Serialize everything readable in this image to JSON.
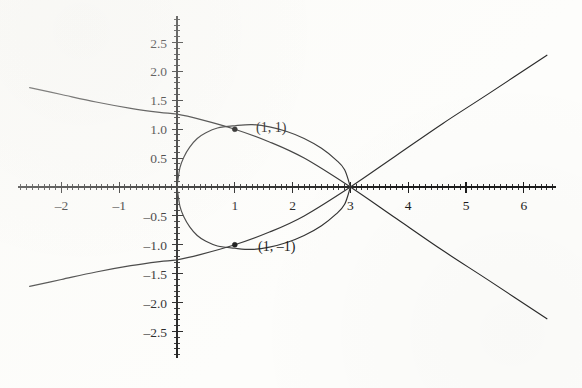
{
  "figure": {
    "title": "",
    "background_color": "#fdfdfb",
    "ink_color": "#2a2a2a",
    "point_labels": [
      {
        "name": "label-point-1-1",
        "text": "(1, 1)",
        "x": 1,
        "y": 1,
        "px": 256,
        "py": 132
      },
      {
        "name": "label-point-1-neg1",
        "text": "(1, –1)",
        "x": 1,
        "y": -1,
        "px": 258,
        "py": 251
      }
    ]
  },
  "axes": {
    "origin_px": {
      "x": 177,
      "y": 187
    },
    "scale_px_per_unit": {
      "x": 57.8,
      "y": 57.8
    },
    "x_axis": {
      "name": "x-axis",
      "range": [
        -2.75,
        6.55
      ],
      "tick_interval_major": 1,
      "tick_interval_minor": 0.1,
      "tick_labels": [
        "–2",
        "–1",
        "1",
        "2",
        "3",
        "4",
        "5",
        "6"
      ],
      "tick_values": [
        -2,
        -1,
        1,
        2,
        3,
        4,
        5,
        6
      ],
      "label_offset_px": 17
    },
    "y_axis": {
      "name": "y-axis",
      "range": [
        -2.95,
        2.95
      ],
      "tick_interval_major": 0.5,
      "tick_interval_minor": 0.1,
      "tick_labels": [
        "2.5",
        "2.0",
        "1.5",
        "1.0",
        "0.5",
        "–0.5",
        "–1.0",
        "–1.5",
        "–2.0",
        "–2.5"
      ],
      "tick_values": [
        2.5,
        2.0,
        1.5,
        1.0,
        0.5,
        -0.5,
        -1.0,
        -1.5,
        -2.0,
        -2.5
      ],
      "label_offset_px": 10
    }
  },
  "chart_data": {
    "type": "line",
    "title": "",
    "xlabel": "",
    "ylabel": "",
    "xlim": [
      -2.75,
      6.55
    ],
    "ylim": [
      -2.95,
      2.95
    ],
    "grid": false,
    "legend": null,
    "annotations": [
      {
        "text": "(1, 1)",
        "x": 1,
        "y": 1
      },
      {
        "text": "(1, –1)",
        "x": 1,
        "y": -1
      }
    ],
    "markers": [
      {
        "x": 1,
        "y": 1,
        "style": "filled-circle",
        "size_px": 5
      },
      {
        "x": 1,
        "y": -1,
        "style": "filled-circle",
        "size_px": 5
      }
    ],
    "series": [
      {
        "name": "loop-curve-upper",
        "description": "Upper half of closed loop from origin through (1,1) to (3,0)",
        "x": [
          0.0,
          0.05,
          0.12,
          0.22,
          0.35,
          0.5,
          0.7,
          1.0,
          1.3,
          1.6,
          1.9,
          2.2,
          2.5,
          2.75,
          2.9,
          3.0
        ],
        "y": [
          0.0,
          0.33,
          0.52,
          0.69,
          0.84,
          0.94,
          1.02,
          1.06,
          1.08,
          1.04,
          0.96,
          0.84,
          0.67,
          0.47,
          0.3,
          0.0
        ]
      },
      {
        "name": "loop-curve-lower",
        "description": "Lower half of closed loop from origin through (1,-1) to (3,0)",
        "x": [
          0.0,
          0.05,
          0.12,
          0.22,
          0.35,
          0.5,
          0.7,
          1.0,
          1.3,
          1.6,
          1.9,
          2.2,
          2.5,
          2.75,
          2.9,
          3.0
        ],
        "y": [
          0.0,
          -0.33,
          -0.52,
          -0.69,
          -0.84,
          -0.94,
          -1.02,
          -1.06,
          -1.08,
          -1.04,
          -0.96,
          -0.84,
          -0.67,
          -0.47,
          -0.3,
          0.0
        ]
      },
      {
        "name": "rising-branch",
        "description": "Increasing curve from (1,-1) region up through (1,1) to upper right",
        "x": [
          -2.55,
          -2.0,
          -1.4,
          -0.8,
          -0.3,
          0.0,
          0.4,
          1.0,
          1.6,
          2.2,
          3.0,
          3.8,
          4.6,
          5.4,
          6.4
        ],
        "y": [
          -1.72,
          -1.6,
          -1.47,
          -1.36,
          -1.29,
          -1.26,
          -1.17,
          -1.0,
          -0.78,
          -0.5,
          0.0,
          0.55,
          1.1,
          1.62,
          2.28
        ]
      },
      {
        "name": "falling-branch",
        "description": "Decreasing curve from upper left through (1,1) to lower right",
        "x": [
          -2.55,
          -2.0,
          -1.4,
          -0.8,
          -0.3,
          0.0,
          0.4,
          1.0,
          1.6,
          2.2,
          3.0,
          3.8,
          4.6,
          5.4,
          6.4
        ],
        "y": [
          1.72,
          1.6,
          1.47,
          1.36,
          1.29,
          1.26,
          1.17,
          1.0,
          0.78,
          0.5,
          0.0,
          -0.55,
          -1.1,
          -1.62,
          -2.28
        ]
      }
    ]
  }
}
